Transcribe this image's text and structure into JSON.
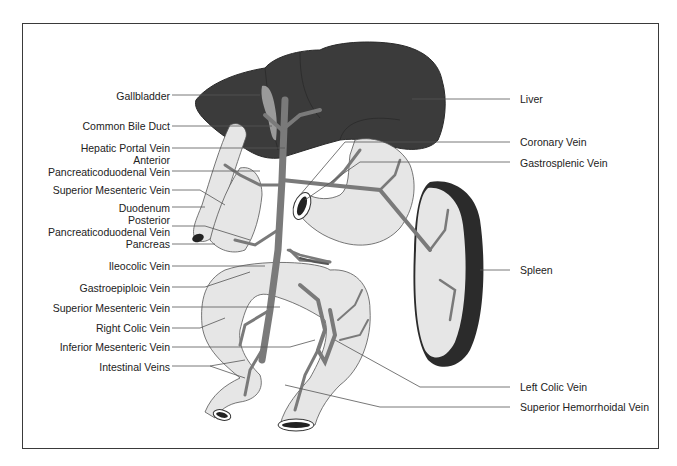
{
  "diagram": {
    "colors": {
      "liver": "#3b3b3b",
      "vein": "#7a7a7a",
      "organ_fill": "#e6e6e6",
      "organ_outline": "#555555",
      "spleen_capsule": "#2b2b2b",
      "leader_line": "#555555",
      "frame": "#3a3a3a"
    },
    "labels_left": [
      {
        "id": "gallbladder",
        "text": "Gallbladder"
      },
      {
        "id": "common-bile-duct",
        "text": "Common Bile Duct"
      },
      {
        "id": "hepatic-portal-vein",
        "text": "Hepatic Portal Vein"
      },
      {
        "id": "anterior-pancreaticoduodenal-vein-1",
        "text": "Anterior"
      },
      {
        "id": "anterior-pancreaticoduodenal-vein-2",
        "text": "Pancreaticoduodenal Vein"
      },
      {
        "id": "superior-mesenteric-vein-upper",
        "text": "Superior Mesenteric Vein"
      },
      {
        "id": "duodenum",
        "text": "Duodenum"
      },
      {
        "id": "posterior-pancreaticoduodenal-vein-1",
        "text": "Posterior"
      },
      {
        "id": "posterior-pancreaticoduodenal-vein-2",
        "text": "Pancreaticoduodenal Vein"
      },
      {
        "id": "pancreas",
        "text": "Pancreas"
      },
      {
        "id": "ileocolic-vein",
        "text": "Ileocolic Vein"
      },
      {
        "id": "gastroepiploic-vein",
        "text": "Gastroepiploic Vein"
      },
      {
        "id": "superior-mesenteric-vein-lower",
        "text": "Superior Mesenteric Vein"
      },
      {
        "id": "right-colic-vein",
        "text": "Right Colic Vein"
      },
      {
        "id": "inferior-mesenteric-vein",
        "text": "Inferior Mesenteric Vein"
      },
      {
        "id": "intestinal-veins",
        "text": "Intestinal Veins"
      }
    ],
    "labels_right": [
      {
        "id": "liver",
        "text": "Liver"
      },
      {
        "id": "coronary-vein",
        "text": "Coronary Vein"
      },
      {
        "id": "gastrosplenic-vein",
        "text": "Gastrosplenic Vein"
      },
      {
        "id": "spleen",
        "text": "Spleen"
      },
      {
        "id": "left-colic-vein",
        "text": "Left Colic Vein"
      },
      {
        "id": "superior-hemorrhoidal-vein",
        "text": "Superior Hemorrhoidal Vein"
      }
    ]
  }
}
